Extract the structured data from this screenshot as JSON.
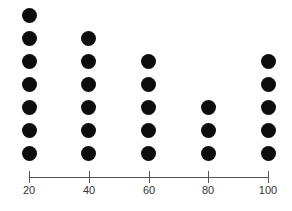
{
  "chart_data": {
    "type": "scatter",
    "subtype": "dot_plot",
    "title": "",
    "xlabel": "",
    "ylabel": "",
    "categories": [
      "20",
      "40",
      "60",
      "80",
      "100"
    ],
    "x": [
      20,
      40,
      60,
      80,
      100
    ],
    "values": [
      7,
      6,
      5,
      3,
      5
    ],
    "xlim": [
      20,
      100
    ],
    "grid": false,
    "legend": null,
    "dot_color": "#0d0d0d",
    "axis_color": "#555555"
  }
}
